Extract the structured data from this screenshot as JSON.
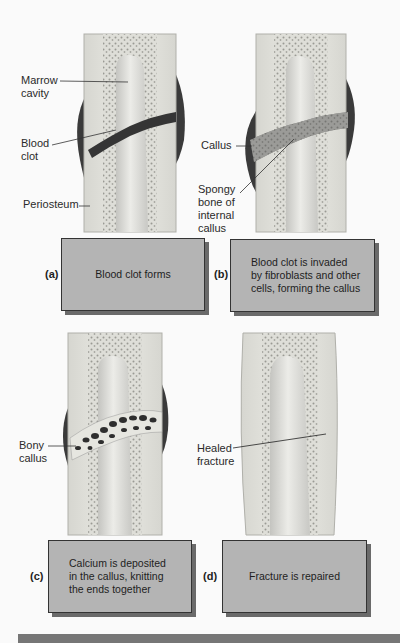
{
  "figure": {
    "panels": [
      {
        "id": "a",
        "letter": "(a)",
        "caption": "Blood clot forms",
        "labels": [
          "Marrow cavity",
          "Blood clot",
          "Periosteum"
        ],
        "label_lines": {
          "marrow_1": "Marrow",
          "marrow_2": "cavity",
          "clot_1": "Blood",
          "clot_2": "clot",
          "periosteum": "Periosteum"
        }
      },
      {
        "id": "b",
        "letter": "(b)",
        "caption": "Blood clot is invaded by fibroblasts and other cells, forming the callus",
        "caption_lines": [
          "Blood clot is invaded",
          "by fibroblasts and other",
          "cells, forming the callus"
        ],
        "labels": [
          "Callus",
          "Spongy bone of internal callus"
        ],
        "label_lines": {
          "callus": "Callus",
          "spongy_1": "Spongy",
          "spongy_2": "bone of",
          "spongy_3": "internal",
          "spongy_4": "callus"
        }
      },
      {
        "id": "c",
        "letter": "(c)",
        "caption": "Calcium is deposited in the callus, knitting the ends together",
        "caption_lines": [
          "Calcium is deposited",
          "in the callus, knitting",
          "the ends together"
        ],
        "labels": [
          "Bony callus"
        ],
        "label_lines": {
          "bony_1": "Bony",
          "bony_2": "callus"
        }
      },
      {
        "id": "d",
        "letter": "(d)",
        "caption": "Fracture is repaired",
        "labels": [
          "Healed fracture"
        ],
        "label_lines": {
          "healed_1": "Healed",
          "healed_2": "fracture"
        }
      }
    ],
    "colors": {
      "caption_box": "#b4b4b4",
      "box_shadow": "#6a6a6a",
      "bone_outer": "#e2e2dc",
      "marrow": "#d0d0cc",
      "clot": "#3a3a3a",
      "bottom_bar": "#767676"
    }
  }
}
